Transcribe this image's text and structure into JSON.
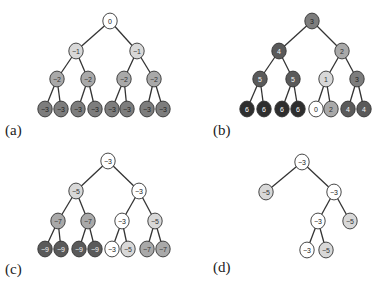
{
  "colors": {
    "white": "#ffffff",
    "light": "#d8d8d8",
    "mid": "#a9a9a9",
    "dark": "#7d7d7d",
    "darker": "#5a5a5a",
    "black": "#2e2e2e",
    "edge": "#333333"
  },
  "panels": [
    {
      "id": "a",
      "label": "(a)",
      "label_pos": [
        5,
        122
      ],
      "nodes": [
        {
          "id": "r",
          "x": 110,
          "y": 21,
          "value": "0",
          "shade": "white"
        },
        {
          "id": "l",
          "x": 76,
          "y": 51,
          "value": "−1",
          "shade": "light",
          "parent": "r"
        },
        {
          "id": "rr",
          "x": 137,
          "y": 51,
          "value": "−1",
          "shade": "light",
          "parent": "r"
        },
        {
          "id": "ll",
          "x": 57,
          "y": 79,
          "value": "−2",
          "shade": "mid",
          "parent": "l"
        },
        {
          "id": "lr",
          "x": 88,
          "y": 79,
          "value": "−2",
          "shade": "mid",
          "parent": "l"
        },
        {
          "id": "rl",
          "x": 124,
          "y": 79,
          "value": "−2",
          "shade": "mid",
          "parent": "rr"
        },
        {
          "id": "rrr",
          "x": 154,
          "y": 79,
          "value": "−2",
          "shade": "mid",
          "parent": "rr"
        },
        {
          "id": "a1",
          "x": 45,
          "y": 109,
          "value": "−3",
          "shade": "dark",
          "parent": "ll"
        },
        {
          "id": "a2",
          "x": 61,
          "y": 109,
          "value": "−3",
          "shade": "dark",
          "parent": "ll"
        },
        {
          "id": "a3",
          "x": 78,
          "y": 109,
          "value": "−3",
          "shade": "dark",
          "parent": "lr"
        },
        {
          "id": "a4",
          "x": 95,
          "y": 109,
          "value": "−3",
          "shade": "dark",
          "parent": "lr"
        },
        {
          "id": "a5",
          "x": 112,
          "y": 109,
          "value": "−3",
          "shade": "dark",
          "parent": "rl"
        },
        {
          "id": "a6",
          "x": 127,
          "y": 109,
          "value": "−3",
          "shade": "dark",
          "parent": "rl"
        },
        {
          "id": "a7",
          "x": 147,
          "y": 109,
          "value": "−3",
          "shade": "dark",
          "parent": "rrr"
        },
        {
          "id": "a8",
          "x": 163,
          "y": 109,
          "value": "−3",
          "shade": "dark",
          "parent": "rrr"
        }
      ]
    },
    {
      "id": "b",
      "label": "(b)",
      "label_pos": [
        213,
        122
      ],
      "nodes": [
        {
          "id": "r",
          "x": 312,
          "y": 21,
          "value": "3",
          "shade": "dark"
        },
        {
          "id": "l",
          "x": 279,
          "y": 51,
          "value": "4",
          "shade": "darker",
          "parent": "r"
        },
        {
          "id": "rr",
          "x": 342,
          "y": 51,
          "value": "2",
          "shade": "mid",
          "parent": "r"
        },
        {
          "id": "ll",
          "x": 260,
          "y": 79,
          "value": "5",
          "shade": "darker",
          "parent": "l"
        },
        {
          "id": "lr",
          "x": 293,
          "y": 79,
          "value": "5",
          "shade": "darker",
          "parent": "l"
        },
        {
          "id": "rl",
          "x": 326,
          "y": 79,
          "value": "1",
          "shade": "light",
          "parent": "rr"
        },
        {
          "id": "rrr",
          "x": 357,
          "y": 79,
          "value": "3",
          "shade": "dark",
          "parent": "rr"
        },
        {
          "id": "b1",
          "x": 247,
          "y": 109,
          "value": "6",
          "shade": "black",
          "parent": "ll"
        },
        {
          "id": "b2",
          "x": 264,
          "y": 109,
          "value": "6",
          "shade": "black",
          "parent": "ll"
        },
        {
          "id": "b3",
          "x": 282,
          "y": 109,
          "value": "6",
          "shade": "black",
          "parent": "lr"
        },
        {
          "id": "b4",
          "x": 298,
          "y": 109,
          "value": "6",
          "shade": "black",
          "parent": "lr"
        },
        {
          "id": "b5",
          "x": 316,
          "y": 109,
          "value": "0",
          "shade": "white",
          "parent": "rl"
        },
        {
          "id": "b6",
          "x": 331,
          "y": 109,
          "value": "2",
          "shade": "mid",
          "parent": "rl"
        },
        {
          "id": "b7",
          "x": 348,
          "y": 109,
          "value": "4",
          "shade": "darker",
          "parent": "rrr"
        },
        {
          "id": "b8",
          "x": 364,
          "y": 109,
          "value": "4",
          "shade": "darker",
          "parent": "rrr"
        }
      ]
    },
    {
      "id": "c",
      "label": "(c)",
      "label_pos": [
        5,
        261
      ],
      "nodes": [
        {
          "id": "r",
          "x": 108,
          "y": 161,
          "value": "−3",
          "shade": "white"
        },
        {
          "id": "l",
          "x": 76,
          "y": 191,
          "value": "−5",
          "shade": "light",
          "parent": "r"
        },
        {
          "id": "rr",
          "x": 139,
          "y": 191,
          "value": "−3",
          "shade": "white",
          "parent": "r"
        },
        {
          "id": "ll",
          "x": 58,
          "y": 221,
          "value": "−7",
          "shade": "mid",
          "parent": "l"
        },
        {
          "id": "lr",
          "x": 88,
          "y": 221,
          "value": "−7",
          "shade": "mid",
          "parent": "l"
        },
        {
          "id": "rl",
          "x": 122,
          "y": 221,
          "value": "−3",
          "shade": "white",
          "parent": "rr"
        },
        {
          "id": "rrr",
          "x": 155,
          "y": 221,
          "value": "−5",
          "shade": "light",
          "parent": "rr"
        },
        {
          "id": "c1",
          "x": 45,
          "y": 249,
          "value": "−9",
          "shade": "darker",
          "parent": "ll"
        },
        {
          "id": "c2",
          "x": 61,
          "y": 249,
          "value": "−9",
          "shade": "darker",
          "parent": "ll"
        },
        {
          "id": "c3",
          "x": 79,
          "y": 249,
          "value": "−9",
          "shade": "darker",
          "parent": "lr"
        },
        {
          "id": "c4",
          "x": 95,
          "y": 249,
          "value": "−9",
          "shade": "darker",
          "parent": "lr"
        },
        {
          "id": "c5",
          "x": 112,
          "y": 249,
          "value": "−3",
          "shade": "white",
          "parent": "rl"
        },
        {
          "id": "c6",
          "x": 128,
          "y": 249,
          "value": "−5",
          "shade": "light",
          "parent": "rl"
        },
        {
          "id": "c7",
          "x": 147,
          "y": 249,
          "value": "−7",
          "shade": "mid",
          "parent": "rrr"
        },
        {
          "id": "c8",
          "x": 163,
          "y": 249,
          "value": "−7",
          "shade": "mid",
          "parent": "rrr"
        }
      ]
    },
    {
      "id": "d",
      "label": "(d)",
      "label_pos": [
        213,
        259
      ],
      "nodes": [
        {
          "id": "r",
          "x": 302,
          "y": 162,
          "value": "−3",
          "shade": "white"
        },
        {
          "id": "l",
          "x": 266,
          "y": 192,
          "value": "−5",
          "shade": "light",
          "parent": "r"
        },
        {
          "id": "rr",
          "x": 334,
          "y": 192,
          "value": "−3",
          "shade": "white",
          "parent": "r"
        },
        {
          "id": "rl",
          "x": 318,
          "y": 221,
          "value": "−3",
          "shade": "white",
          "parent": "rr"
        },
        {
          "id": "rrr",
          "x": 350,
          "y": 221,
          "value": "−5",
          "shade": "light",
          "parent": "rr"
        },
        {
          "id": "d1",
          "x": 307,
          "y": 250,
          "value": "−3",
          "shade": "white",
          "parent": "rl"
        },
        {
          "id": "d2",
          "x": 326,
          "y": 250,
          "value": "−5",
          "shade": "light",
          "parent": "rl"
        }
      ]
    }
  ],
  "node_radius": 7.2
}
